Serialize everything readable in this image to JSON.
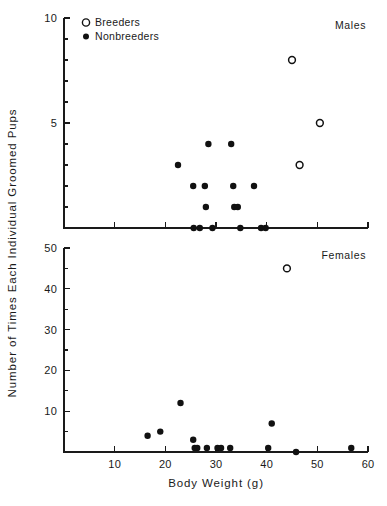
{
  "chart_data": {
    "type": "scatter",
    "title": "",
    "xlabel": "Body Weight (g)",
    "ylabel": "Number of Times Each Individual Groomed Pups",
    "xlim": [
      0,
      60
    ],
    "xticks": [
      10,
      20,
      30,
      40,
      50,
      60
    ],
    "xtick_labels": [
      "10",
      "20",
      "30",
      "40",
      "50",
      "60"
    ],
    "grid": false,
    "legend": {
      "position": "top-left",
      "entries": [
        {
          "label": "Breeders",
          "marker": "open-circle"
        },
        {
          "label": "Nonbreeders",
          "marker": "filled-circle"
        }
      ]
    },
    "panels": [
      {
        "name": "males",
        "label": "Males",
        "ylim": [
          0,
          10
        ],
        "yticks": [
          5,
          10
        ],
        "ytick_labels": [
          "5",
          "10"
        ],
        "yminor_ticks": [
          1,
          2,
          3,
          4,
          6,
          7,
          8,
          9
        ],
        "series": [
          {
            "name": "Nonbreeders",
            "marker": "filled-circle",
            "points": [
              {
                "x": 22.5,
                "y": 3
              },
              {
                "x": 25.5,
                "y": 2
              },
              {
                "x": 27.8,
                "y": 2
              },
              {
                "x": 28.5,
                "y": 4
              },
              {
                "x": 28.0,
                "y": 1
              },
              {
                "x": 33.0,
                "y": 4
              },
              {
                "x": 33.4,
                "y": 2
              },
              {
                "x": 37.5,
                "y": 2
              },
              {
                "x": 33.6,
                "y": 1
              },
              {
                "x": 34.3,
                "y": 1
              },
              {
                "x": 25.6,
                "y": 0
              },
              {
                "x": 26.8,
                "y": 0
              },
              {
                "x": 29.3,
                "y": 0
              },
              {
                "x": 34.8,
                "y": 0
              },
              {
                "x": 38.9,
                "y": 0
              },
              {
                "x": 39.8,
                "y": 0
              }
            ]
          },
          {
            "name": "Breeders",
            "marker": "open-circle",
            "points": [
              {
                "x": 45.0,
                "y": 8
              },
              {
                "x": 50.5,
                "y": 5
              },
              {
                "x": 46.5,
                "y": 3
              }
            ]
          }
        ]
      },
      {
        "name": "females",
        "label": "Females",
        "ylim": [
          0,
          50
        ],
        "yticks": [
          10,
          20,
          30,
          40,
          50
        ],
        "ytick_labels": [
          "10",
          "20",
          "30",
          "40",
          "50"
        ],
        "yminor_ticks": [
          5,
          15,
          25,
          35,
          45
        ],
        "series": [
          {
            "name": "Nonbreeders",
            "marker": "filled-circle",
            "points": [
              {
                "x": 16.5,
                "y": 4
              },
              {
                "x": 19.0,
                "y": 5
              },
              {
                "x": 23.0,
                "y": 12
              },
              {
                "x": 25.5,
                "y": 3
              },
              {
                "x": 25.8,
                "y": 1
              },
              {
                "x": 26.3,
                "y": 1
              },
              {
                "x": 28.2,
                "y": 1
              },
              {
                "x": 30.3,
                "y": 1
              },
              {
                "x": 31.0,
                "y": 1
              },
              {
                "x": 32.8,
                "y": 1
              },
              {
                "x": 40.3,
                "y": 1
              },
              {
                "x": 41.0,
                "y": 7
              },
              {
                "x": 45.8,
                "y": 0
              },
              {
                "x": 56.7,
                "y": 1
              }
            ]
          },
          {
            "name": "Breeders",
            "marker": "open-circle",
            "points": [
              {
                "x": 44.0,
                "y": 45
              }
            ]
          }
        ]
      }
    ]
  }
}
